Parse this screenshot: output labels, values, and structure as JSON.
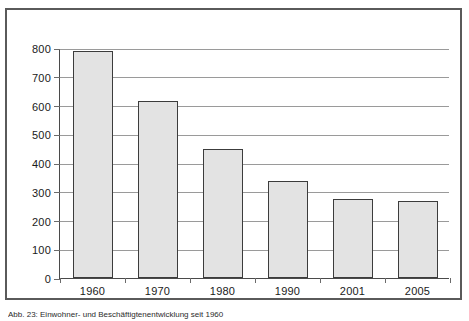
{
  "figure": {
    "caption": "Abb. 23: Einwohner- und Beschäftigtenentwicklung seit 1960"
  },
  "chart_data": {
    "type": "bar",
    "title": "",
    "subtitle": "",
    "xlabel": "",
    "ylabel": "",
    "categories": [
      "1960",
      "1970",
      "1980",
      "1990",
      "2001",
      "2005"
    ],
    "values": [
      788,
      615,
      450,
      337,
      275,
      268
    ],
    "ylim": [
      0,
      800
    ],
    "ytick_labels": [
      "0",
      "100",
      "200",
      "300",
      "400",
      "500",
      "600",
      "700",
      "800"
    ],
    "ytick_values": [
      0,
      100,
      200,
      300,
      400,
      500,
      600,
      700,
      800
    ],
    "grid": true,
    "grid_axis": "y",
    "legend": false,
    "legend_position": "none",
    "bar_fill_color": "#e3e3e3",
    "bar_border_color": "#3c3c3c",
    "gridline_color": "#9a9a9a",
    "axis_color": "#4a4a4a",
    "frame_color": "#5a5a5a",
    "background_color": "#ffffff"
  }
}
